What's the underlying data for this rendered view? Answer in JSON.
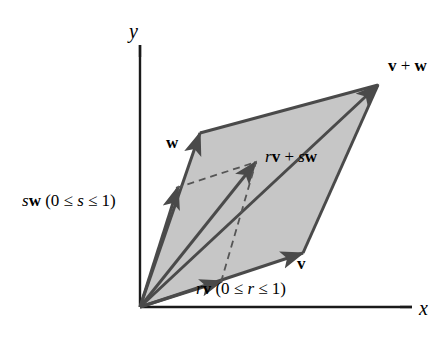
{
  "figure": {
    "type": "vector-diagram",
    "background_color": "#ffffff",
    "fill_color": "#c6c6c6",
    "stroke_color": "#4a4a4a",
    "axis_color": "#1a1a1a",
    "dash_color": "#555555",
    "text_color": "#000000"
  },
  "axes": {
    "x_label": "x",
    "y_label": "y",
    "origin": {
      "x": 140,
      "y": 307
    },
    "x_end": {
      "x": 412,
      "y": 307
    },
    "y_end": {
      "x": 140,
      "y": 45
    }
  },
  "labels": {
    "vector_w": "w",
    "vector_v": "v",
    "vector_sum": {
      "v": "v",
      "plus": " + ",
      "w": "w",
      "full": "v + w"
    },
    "point_combo": {
      "r": "r",
      "v": "v",
      "plus": " + ",
      "s": "s",
      "w": "w",
      "full": "rv + sw"
    },
    "sw_range": {
      "s": "s",
      "w": "w",
      "open": " (0 ≤ ",
      "var": "s",
      "close": " ≤ 1)",
      "full": "sw (0 ≤ s ≤ 1)"
    },
    "rv_range": {
      "r": "r",
      "v": "v",
      "open": " (0 ≤ ",
      "var": "r",
      "close": " ≤ 1)",
      "full": "rv (0 ≤ r ≤ 1)"
    }
  },
  "geometry": {
    "origin": {
      "x": 140,
      "y": 307
    },
    "w_tip": {
      "x": 200,
      "y": 133
    },
    "v_tip": {
      "x": 303,
      "y": 253
    },
    "sum_tip": {
      "x": 378,
      "y": 85
    },
    "combo_point": {
      "x": 256,
      "y": 162
    },
    "sw_arrow_tip": {
      "x": 178,
      "y": 187
    },
    "rv_arrow_tip": {
      "x": 222,
      "y": 281
    }
  }
}
